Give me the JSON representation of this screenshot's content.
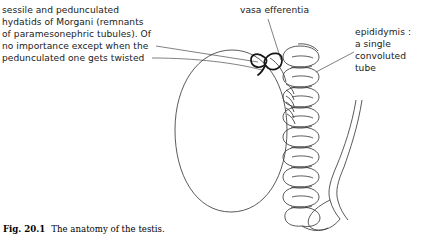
{
  "figure": {
    "caption_number": "Fig. 20.1",
    "caption_text": "The anatomy of the testis.",
    "background_color": "#ffffff",
    "ink_color": "#3c3c3c",
    "ink_dark_color": "#151515"
  },
  "labels": {
    "hydatids": {
      "text": "sessile and pedunculated\nhydatids of Morgani (remnants\nof paramesonephric tubules). Of\nno importance except when the\npedunculated one gets twisted"
    },
    "vasa_efferentia": {
      "text": "vasa efferentia"
    },
    "epididymis": {
      "text": "epididymis :\na single\nconvoluted\ntube"
    }
  },
  "structures": {
    "testis": "testis-outline",
    "hydatid_sessile": "sessile-hydatid",
    "hydatid_pedunculated": "pedunculated-hydatid",
    "vasa_efferentia": "vasa-efferentia-ducts",
    "epididymis": "epididymis-coil",
    "vas_deferens": "vas-deferens"
  }
}
